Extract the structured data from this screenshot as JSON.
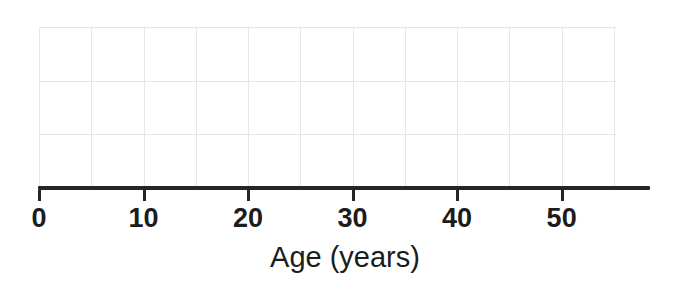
{
  "chart_data": {
    "type": "line",
    "title": "",
    "subtitle": "",
    "xlabel": "Age (years)",
    "ylabel": "",
    "xlim": [
      0,
      55.2
    ],
    "ylim": [
      0,
      3
    ],
    "x_ticks": [
      0,
      10,
      20,
      30,
      40,
      50
    ],
    "x_tick_labels": [
      "0",
      "10",
      "20",
      "30",
      "40",
      "50"
    ],
    "y_ticks": [],
    "y_tick_labels": [],
    "x_minor_gridlines": [
      0,
      5,
      10,
      15,
      20,
      25,
      30,
      35,
      40,
      45,
      50,
      55
    ],
    "y_gridlines": [
      1,
      2,
      3
    ],
    "grid": true,
    "legend": [],
    "legend_position": "none",
    "annotations": [],
    "series": [],
    "x": [],
    "values": [],
    "note": "Empty plot frame: horizontal axis only, no data series plotted."
  },
  "axis": {
    "title": "Age (years)",
    "ticks": [
      {
        "value": 0,
        "label": "0"
      },
      {
        "value": 10,
        "label": "10"
      },
      {
        "value": 20,
        "label": "20"
      },
      {
        "value": 30,
        "label": "30"
      },
      {
        "value": 40,
        "label": "40"
      },
      {
        "value": 50,
        "label": "50"
      }
    ]
  },
  "colors": {
    "background": "#ffffff",
    "axis": "#262626",
    "gridline": "#e6e6e6",
    "text": "#1c1c1c"
  }
}
